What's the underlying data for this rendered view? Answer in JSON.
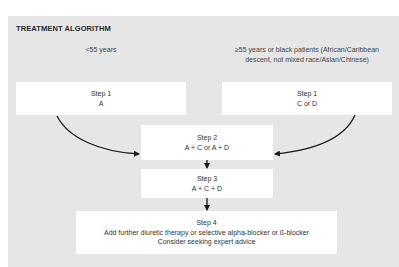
{
  "title": "TREATMENT ALGORITHM",
  "groups": {
    "left": {
      "label": "<55 years"
    },
    "right": {
      "label_line1": "≥55 years or black patients (African/Caribbean",
      "label_line2": "descent, not mixed race/Asian/Chinese)"
    }
  },
  "steps": {
    "step1_left": {
      "title": "Step 1",
      "text": "A"
    },
    "step1_right": {
      "title": "Step 1",
      "text": "C or D"
    },
    "step2": {
      "title": "Step 2",
      "text": "A + C or A + D"
    },
    "step3": {
      "title": "Step 3",
      "text": "A + C + D"
    },
    "step4": {
      "title": "Step 4",
      "text_line1": "Add further diuretic therapy or selective alpha-blocker or ß-blocker",
      "text_line2": "Consider seeking expert advice"
    }
  },
  "colors": {
    "panel_bg": "#e6e6e6",
    "box_bg": "#ffffff",
    "arrow": "#1a1a1a"
  }
}
